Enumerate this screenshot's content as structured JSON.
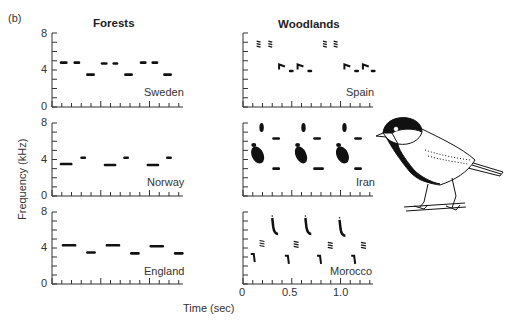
{
  "figure": {
    "panel_label": "(b)",
    "columns": [
      "Forests",
      "Woodlands"
    ],
    "ylabel": "Frequency (kHz)",
    "xlabel": "Time (sec)",
    "illustration": "great-tit-bird-drawing"
  },
  "chart_data": {
    "type": "scatter",
    "xlabel": "Time (sec)",
    "ylabel": "Frequency (kHz)",
    "ylim": [
      0,
      8
    ],
    "xlim": [
      0,
      1.35
    ],
    "xticks": [
      "0",
      "0.5",
      "1.0"
    ],
    "yticks": [
      "0",
      "4",
      "8"
    ],
    "grid": false,
    "panels": [
      {
        "column": "Forests",
        "region": "Sweden",
        "notes": [
          {
            "t": 0.08,
            "dur": 0.08,
            "f": 4.8
          },
          {
            "t": 0.22,
            "dur": 0.07,
            "f": 4.8
          },
          {
            "t": 0.35,
            "dur": 0.09,
            "f": 3.5
          },
          {
            "t": 0.5,
            "dur": 0.07,
            "f": 4.7
          },
          {
            "t": 0.62,
            "dur": 0.06,
            "f": 4.7
          },
          {
            "t": 0.74,
            "dur": 0.09,
            "f": 3.5
          },
          {
            "t": 0.9,
            "dur": 0.07,
            "f": 4.8
          },
          {
            "t": 1.02,
            "dur": 0.07,
            "f": 4.8
          },
          {
            "t": 1.14,
            "dur": 0.09,
            "f": 3.5
          }
        ]
      },
      {
        "column": "Woodlands",
        "region": "Spain",
        "notes": [
          {
            "t": 0.14,
            "dur": 0.04,
            "f": 6.8,
            "shape": "chirp"
          },
          {
            "t": 0.26,
            "dur": 0.04,
            "f": 6.8,
            "shape": "chirp"
          },
          {
            "t": 0.37,
            "dur": 0.06,
            "f": 4.6,
            "shape": "hook"
          },
          {
            "t": 0.47,
            "dur": 0.05,
            "f": 3.9
          },
          {
            "t": 0.56,
            "dur": 0.06,
            "f": 4.6,
            "shape": "hook"
          },
          {
            "t": 0.66,
            "dur": 0.05,
            "f": 3.9
          },
          {
            "t": 0.82,
            "dur": 0.04,
            "f": 6.8,
            "shape": "chirp"
          },
          {
            "t": 0.93,
            "dur": 0.04,
            "f": 6.8,
            "shape": "chirp"
          },
          {
            "t": 1.04,
            "dur": 0.06,
            "f": 4.6,
            "shape": "hook"
          },
          {
            "t": 1.14,
            "dur": 0.05,
            "f": 3.9
          },
          {
            "t": 1.23,
            "dur": 0.06,
            "f": 4.6,
            "shape": "hook"
          },
          {
            "t": 1.31,
            "dur": 0.05,
            "f": 3.9
          }
        ]
      },
      {
        "column": "Forests",
        "region": "Norway",
        "notes": [
          {
            "t": 0.08,
            "dur": 0.13,
            "f": 3.5
          },
          {
            "t": 0.29,
            "dur": 0.06,
            "f": 4.2
          },
          {
            "t": 0.53,
            "dur": 0.13,
            "f": 3.4
          },
          {
            "t": 0.73,
            "dur": 0.06,
            "f": 4.2
          },
          {
            "t": 0.97,
            "dur": 0.13,
            "f": 3.4
          },
          {
            "t": 1.17,
            "dur": 0.06,
            "f": 4.2
          }
        ]
      },
      {
        "column": "Woodlands",
        "region": "Iran",
        "notes": [
          {
            "t": 0.17,
            "dur": 0.04,
            "f": 7.5,
            "shape": "blob"
          },
          {
            "t": 0.1,
            "dur": 0.1,
            "f": 4.5,
            "shape": "blob-large"
          },
          {
            "t": 0.3,
            "dur": 0.08,
            "f": 6.3
          },
          {
            "t": 0.3,
            "dur": 0.08,
            "f": 3.0
          },
          {
            "t": 0.6,
            "dur": 0.04,
            "f": 7.5,
            "shape": "blob"
          },
          {
            "t": 0.55,
            "dur": 0.09,
            "f": 4.5,
            "shape": "blob-large"
          },
          {
            "t": 0.72,
            "dur": 0.08,
            "f": 6.3
          },
          {
            "t": 0.72,
            "dur": 0.11,
            "f": 3.0
          },
          {
            "t": 1.02,
            "dur": 0.04,
            "f": 7.5,
            "shape": "blob"
          },
          {
            "t": 0.97,
            "dur": 0.1,
            "f": 4.5,
            "shape": "blob-large"
          },
          {
            "t": 1.14,
            "dur": 0.08,
            "f": 6.3
          },
          {
            "t": 1.14,
            "dur": 0.08,
            "f": 3.0
          }
        ]
      },
      {
        "column": "Forests",
        "region": "England",
        "notes": [
          {
            "t": 0.1,
            "dur": 0.15,
            "f": 4.3
          },
          {
            "t": 0.35,
            "dur": 0.1,
            "f": 3.5
          },
          {
            "t": 0.55,
            "dur": 0.15,
            "f": 4.3
          },
          {
            "t": 0.8,
            "dur": 0.1,
            "f": 3.4
          },
          {
            "t": 1.0,
            "dur": 0.15,
            "f": 4.2
          },
          {
            "t": 1.25,
            "dur": 0.1,
            "f": 3.4
          }
        ]
      },
      {
        "column": "Woodlands",
        "region": "Morocco",
        "notes": [
          {
            "t": 0.1,
            "dur": 0.03,
            "f": 3.0,
            "shape": "hook-down"
          },
          {
            "t": 0.17,
            "dur": 0.05,
            "f": 4.5,
            "shape": "chirp"
          },
          {
            "t": 0.3,
            "dur": 0.06,
            "f": 6.0,
            "shape": "descending"
          },
          {
            "t": 0.45,
            "dur": 0.03,
            "f": 2.8,
            "shape": "hook-down"
          },
          {
            "t": 0.52,
            "dur": 0.05,
            "f": 4.4,
            "shape": "chirp"
          },
          {
            "t": 0.64,
            "dur": 0.06,
            "f": 6.0,
            "shape": "descending"
          },
          {
            "t": 0.78,
            "dur": 0.03,
            "f": 2.8,
            "shape": "hook-down"
          },
          {
            "t": 0.87,
            "dur": 0.05,
            "f": 4.3,
            "shape": "chirp"
          },
          {
            "t": 0.99,
            "dur": 0.06,
            "f": 5.8,
            "shape": "descending"
          },
          {
            "t": 1.13,
            "dur": 0.03,
            "f": 2.8,
            "shape": "hook-down"
          },
          {
            "t": 1.21,
            "dur": 0.05,
            "f": 4.3,
            "shape": "chirp"
          }
        ]
      }
    ]
  }
}
